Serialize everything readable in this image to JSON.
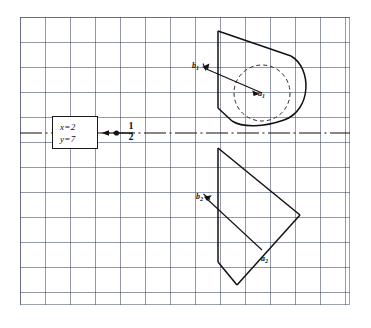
{
  "figure": {
    "kind": "engineering-drawing",
    "medium": "graph-paper",
    "background_color": "#ffffff",
    "grid": {
      "minor_spacing_px": 5,
      "major_spacing_px": 25,
      "minor_color": "#7882 9b",
      "major_color": "#3c465f"
    },
    "ink_color": "#111111"
  },
  "coordinate_box": {
    "x_label": "x=2",
    "y_label": "y=7"
  },
  "axis": {
    "style": "center-line (dash-dot)",
    "label_numerator": "1",
    "label_denominator": "2"
  },
  "labels": {
    "b1": "b",
    "b1_sub": "1",
    "a1": "a",
    "a1_sub": "1",
    "b2": "b",
    "b2_sub": "2",
    "a2": "a",
    "a2_sub": "2"
  },
  "upper_view": {
    "name": "front-view-with-hidden-circle",
    "outline": "rounded-end plate, sloped top edge, semicircular right end",
    "hidden_circle": "dashed",
    "arrow": "from a1 to b1"
  },
  "lower_view": {
    "name": "side-view-chevron",
    "outline": "chevron / folded parallelogram",
    "arrow": "from a2 to b2"
  }
}
